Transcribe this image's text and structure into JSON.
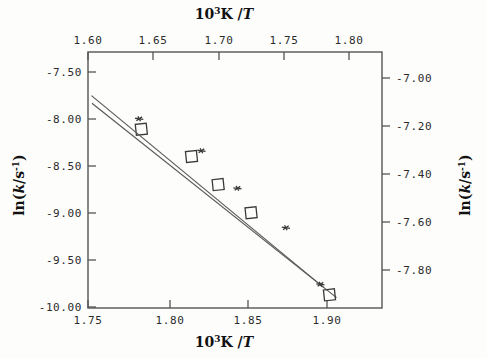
{
  "figure": {
    "background_color": "#fdfdfc",
    "line_color": "#555555",
    "marker_color": "#3a3a3a"
  },
  "axes": {
    "top": {
      "title_prefix": "10",
      "title_sup": "3",
      "title_mid": "K /",
      "title_var": "T",
      "title_plain": "10³K /T",
      "ticks": [
        "1.60",
        "1.65",
        "1.70",
        "1.75",
        "1.80"
      ],
      "range": [
        1.6,
        1.8125
      ]
    },
    "bottom": {
      "title_prefix": "10",
      "title_sup": "3",
      "title_mid": "K /",
      "title_var": "T",
      "title_plain": "10³K /T",
      "ticks": [
        "1.75",
        "1.80",
        "1.85",
        "1.90"
      ],
      "range": [
        1.75,
        1.9375
      ]
    },
    "left": {
      "title_plain": "ln(k/s⁻¹)",
      "title_pre": "ln(",
      "title_var": "k",
      "title_post": "/s",
      "title_sup": "-1",
      "title_close": ")",
      "ticks": [
        "-7.50",
        "-8.00",
        "-8.50",
        "-9.00",
        "-9.50",
        "-10.00"
      ],
      "range": [
        -10.05,
        -7.29
      ]
    },
    "right": {
      "title_plain": "ln(k/s⁻¹)",
      "title_pre": "ln(",
      "title_var": "k",
      "title_post": "/s",
      "title_sup": "-1",
      "title_close": ")",
      "ticks": [
        "-7.00",
        "-7.20",
        "-7.40",
        "-7.60",
        "-7.80"
      ],
      "range": [
        -7.92,
        -6.81
      ]
    }
  },
  "chart_data": {
    "type": "scatter",
    "title": "",
    "xlabel": "10³K /T",
    "ylabel": "ln(k/s⁻¹)",
    "grid": false,
    "legend": "none",
    "xlim_bottom": [
      1.75,
      1.9375
    ],
    "xlim_top": [
      1.6,
      1.8125
    ],
    "ylim_left": [
      -10.05,
      -7.29
    ],
    "ylim_right": [
      -7.92,
      -6.81
    ],
    "series": [
      {
        "name": "open-square series",
        "marker": "open-square",
        "x_axis": "bottom",
        "y_axis": "right",
        "x": [
          1.784,
          1.816,
          1.833,
          1.854,
          1.904
        ],
        "y": [
          -7.145,
          -7.263,
          -7.385,
          -7.507,
          -7.863
        ],
        "fit_line": {
          "x": [
            1.7525,
            1.9085
          ],
          "y": [
            -7.032,
            -7.875
          ],
          "slope": -5.4,
          "intercept": 2.43
        }
      },
      {
        "name": "asterisk series",
        "marker": "asterisk",
        "x_axis": "top",
        "y_axis": "left",
        "x": [
          1.637,
          1.682,
          1.708,
          1.743,
          1.768
        ],
        "y": [
          -8.01,
          -8.355,
          -8.76,
          -9.185,
          -9.795
        ],
        "fit_line": {
          "x": [
            1.6025,
            1.7705
          ],
          "y": [
            -7.76,
            -9.83
          ],
          "slope": -12.32,
          "intercept": 12.0
        }
      }
    ]
  }
}
